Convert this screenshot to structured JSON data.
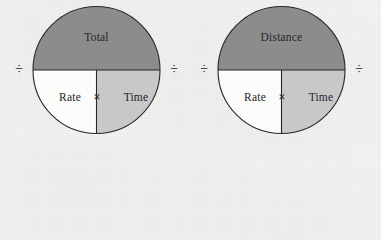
{
  "figure": {
    "background_color": "#f3f3f2",
    "line_color": "#26262c",
    "shade_top_color": "#8c8c8c",
    "shade_bottom_right_color": "#c8c8c8",
    "shade_bottom_left_color": "#fbfbfa"
  },
  "wheels": [
    {
      "id": "wheel-total",
      "top_label": "Total",
      "bottom_left_label": "Rate",
      "operator_center": "×",
      "bottom_right_label": "Time",
      "divide_left": "÷",
      "divide_right": "÷"
    },
    {
      "id": "wheel-distance",
      "top_label": "Distance",
      "bottom_left_label": "Rate",
      "operator_center": "×",
      "bottom_right_label": "Time",
      "divide_left": "÷",
      "divide_right": "÷"
    }
  ]
}
